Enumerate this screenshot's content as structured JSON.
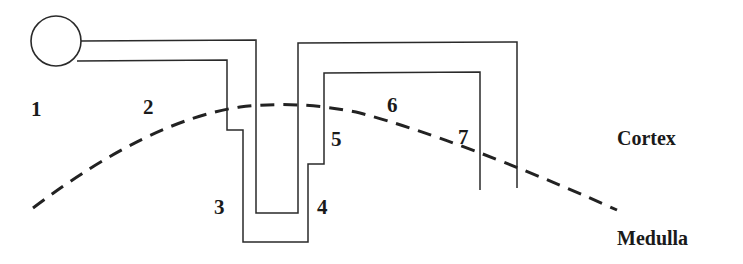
{
  "diagram": {
    "segment_labels": [
      "1",
      "2",
      "3",
      "4",
      "5",
      "6",
      "7"
    ],
    "regions": {
      "upper": "Cortex",
      "lower": "Medulla"
    },
    "colors": {
      "stroke": "#2a2a2a",
      "text": "#1a1a1a",
      "background": "#ffffff"
    }
  }
}
